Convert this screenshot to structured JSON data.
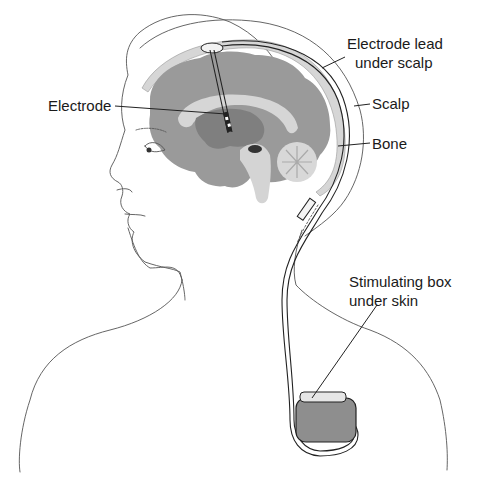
{
  "figure": {
    "colors": {
      "brain": "#9a9a9a",
      "brain_dark": "#7f7f7f",
      "white_matter": "#d4d4d4",
      "bone": "#d6d6d6",
      "outline": "#555555",
      "background": "#ffffff"
    }
  },
  "labels": {
    "electrode": "Electrode",
    "lead_line1": "Electrode lead",
    "lead_line2": "under scalp",
    "scalp": "Scalp",
    "bone": "Bone",
    "box_line1": "Stimulating box",
    "box_line2": "under skin"
  }
}
